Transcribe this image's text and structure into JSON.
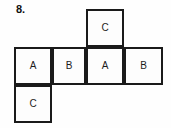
{
  "question": {
    "number_label": "8."
  },
  "figure": {
    "type": "cube-net",
    "border_color": "#1a1a1a",
    "face_text_color": "#1c1c1c",
    "background_color": "#fdfdfd",
    "faces": [
      {
        "id": "top-c",
        "letter": "C",
        "row": "top",
        "column": 3
      },
      {
        "id": "row-a1",
        "letter": "A",
        "row": "middle",
        "column": 1
      },
      {
        "id": "row-b1",
        "letter": "B",
        "row": "middle",
        "column": 2
      },
      {
        "id": "row-a2",
        "letter": "A",
        "row": "middle",
        "column": 3
      },
      {
        "id": "row-b2",
        "letter": "B",
        "row": "middle",
        "column": 4
      },
      {
        "id": "bottom-c",
        "letter": "C",
        "row": "bottom",
        "column": 1
      }
    ]
  }
}
